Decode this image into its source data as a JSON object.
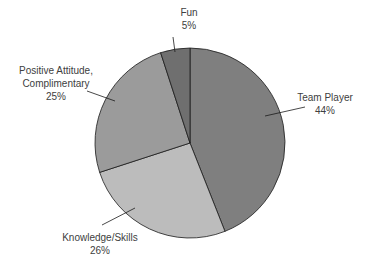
{
  "chart_data": {
    "type": "pie",
    "title": "",
    "categories": [
      "Team Player",
      "Knowledge/Skills",
      "Positive Attitude, Complimentary",
      "Fun"
    ],
    "values": [
      44,
      26,
      25,
      5
    ],
    "value_labels": [
      "44%",
      "26%",
      "25%",
      "5%"
    ],
    "colors": [
      "#7f7f7f",
      "#bcbcbc",
      "#9b9b9b",
      "#6f6f6f"
    ],
    "start_angle_deg": 0,
    "direction": "clockwise",
    "legend": "none",
    "data_labels": "outside with leader lines"
  },
  "labels": {
    "team_player": {
      "name": "Team Player",
      "pct": "44%"
    },
    "knowledge": {
      "name": "Knowledge/Skills",
      "pct": "26%"
    },
    "positive_1": {
      "name": "Positive Attitude,",
      "name2": "Complimentary",
      "pct": "25%"
    },
    "fun": {
      "name": "Fun",
      "pct": "5%"
    }
  }
}
